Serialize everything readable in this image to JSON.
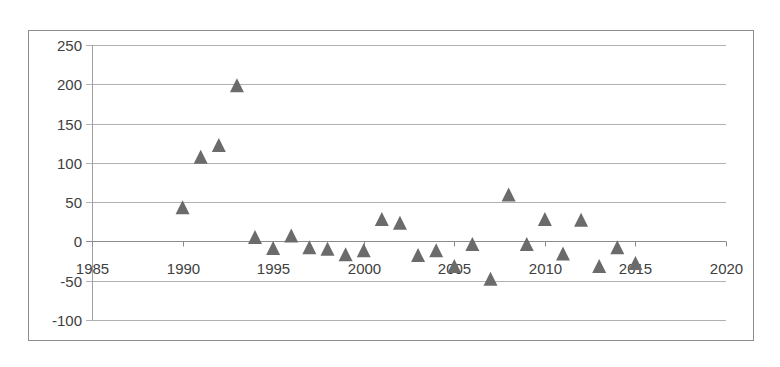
{
  "chart_data": {
    "type": "scatter",
    "title": "",
    "xlabel": "",
    "ylabel": "",
    "xlim": [
      1985,
      2020
    ],
    "ylim": [
      -100,
      250
    ],
    "x_ticks": [
      1985,
      1990,
      1995,
      2000,
      2005,
      2010,
      2015,
      2020
    ],
    "y_ticks": [
      250,
      200,
      150,
      100,
      50,
      0,
      -50,
      -100
    ],
    "x_tick_labels": [
      "1985",
      "1990",
      "1995",
      "2000",
      "2005",
      "2010",
      "2015",
      "2020"
    ],
    "y_tick_labels": [
      "250",
      "200",
      "150",
      "100",
      "50",
      "0",
      "-50",
      "-100"
    ],
    "grid": {
      "horizontal": true,
      "vertical": false
    },
    "legend": null,
    "marker": "triangle",
    "marker_color": "#6b6b6b",
    "gridline_color": "#b0b0b0",
    "series": [
      {
        "name": "Series1",
        "x": [
          1990,
          1991,
          1992,
          1993,
          1994,
          1995,
          1996,
          1997,
          1998,
          1999,
          2000,
          2001,
          2002,
          2003,
          2004,
          2005,
          2006,
          2007,
          2008,
          2009,
          2010,
          2011,
          2012,
          2013,
          2014,
          2015
        ],
        "y": [
          43,
          107,
          122,
          198,
          5,
          -9,
          7,
          -8,
          -10,
          -17,
          -12,
          28,
          23,
          -18,
          -12,
          -32,
          -4,
          -48,
          59,
          -4,
          28,
          -16,
          27,
          -32,
          -8,
          -28
        ]
      }
    ]
  }
}
